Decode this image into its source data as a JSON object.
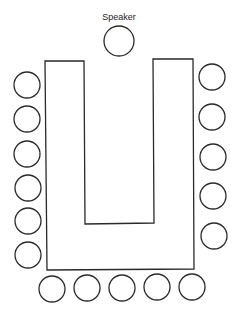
{
  "diagram": {
    "speaker_label": "Speaker",
    "colors": {
      "stroke": "#2a2a2a",
      "background": "#ffffff"
    },
    "speaker_seat": {
      "cx": 119,
      "cy": 41,
      "r": 15
    },
    "table_u_shape": {
      "points": "45,61 84,61 85,224 154,223 153,59 193,59 194,269 47,270"
    },
    "seat_radius": 13,
    "left_seats": [
      {
        "cx": 27,
        "cy": 85
      },
      {
        "cx": 27,
        "cy": 119
      },
      {
        "cx": 27,
        "cy": 154
      },
      {
        "cx": 28,
        "cy": 188
      },
      {
        "cx": 28,
        "cy": 221
      },
      {
        "cx": 28,
        "cy": 255
      }
    ],
    "right_seats": [
      {
        "cx": 212,
        "cy": 77
      },
      {
        "cx": 212,
        "cy": 117
      },
      {
        "cx": 213,
        "cy": 157
      },
      {
        "cx": 213,
        "cy": 196
      },
      {
        "cx": 214,
        "cy": 236
      }
    ],
    "bottom_seats": [
      {
        "cx": 52,
        "cy": 289
      },
      {
        "cx": 87,
        "cy": 288
      },
      {
        "cx": 122,
        "cy": 288
      },
      {
        "cx": 157,
        "cy": 287
      },
      {
        "cx": 192,
        "cy": 287
      }
    ]
  }
}
